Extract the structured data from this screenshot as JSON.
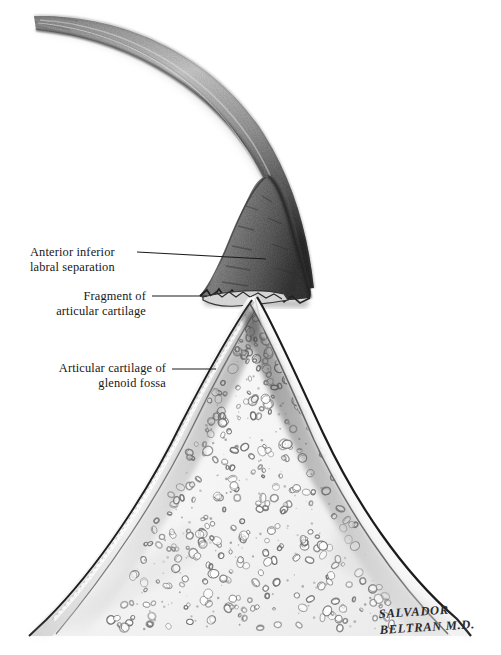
{
  "figure": {
    "type": "medical-illustration",
    "medium": "graphite pencil drawing",
    "background_color": "#ffffff",
    "ink_color": "#171717"
  },
  "labels": [
    {
      "id": "labral-separation",
      "lines": [
        "Anterior inferior",
        "labral separation"
      ],
      "text_anchor": "start",
      "text_x": 30,
      "line1_y": 256,
      "line2_y": 271,
      "leader": {
        "x1": 137,
        "y1": 252,
        "x2": 266,
        "y2": 259
      }
    },
    {
      "id": "cartilage-fragment",
      "lines": [
        "Fragment of",
        "articular cartilage"
      ],
      "text_anchor": "end",
      "text_x": 146,
      "line1_y": 300,
      "line2_y": 315,
      "leader": {
        "x1": 152,
        "y1": 296,
        "x2": 207,
        "y2": 296
      }
    },
    {
      "id": "glenoid-cartilage",
      "lines": [
        "Articular cartilage of",
        "glenoid fossa"
      ],
      "text_anchor": "end",
      "text_x": 166,
      "line1_y": 372,
      "line2_y": 387,
      "leader": {
        "x1": 172,
        "y1": 369,
        "x2": 216,
        "y2": 369
      }
    }
  ],
  "signature": {
    "line1": "SALVADOR",
    "line2": "BELTRAN M.D.",
    "x": 379,
    "line1_y": 618,
    "line2_y": 634,
    "rotation": -3.5
  },
  "caption": {
    "text": "",
    "x": 8,
    "y": 652,
    "visible": false
  },
  "structures": [
    {
      "id": "joint-capsule",
      "name": "joint capsule / superior band",
      "tone": "#5e5e5e"
    },
    {
      "id": "labrum",
      "name": "detached anterior inferior labrum",
      "tone": "#4a4a4a"
    },
    {
      "id": "cartilage-flap",
      "name": "avulsed articular cartilage fragment",
      "tone": "#6a6a6a"
    },
    {
      "id": "glenoid-bone",
      "name": "glenoid fossa cancellous bone",
      "tone": "#f2f2f2"
    },
    {
      "id": "glenoid-cartilage-band",
      "name": "articular cartilage of glenoid fossa",
      "tone": "#e4e4e4"
    }
  ],
  "trabeculae": {
    "count": 320,
    "seed": 20170427,
    "fill": "#ffffff",
    "stroke": "#6f6f6f",
    "min_radius": 1.6,
    "max_radius": 4.6
  }
}
